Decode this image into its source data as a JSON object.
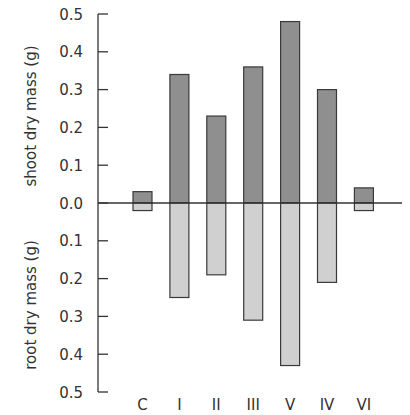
{
  "chart_data": {
    "type": "bar",
    "orientation": "mirrored-vertical",
    "categories": [
      "C",
      "I",
      "II",
      "III",
      "V",
      "IV",
      "VI"
    ],
    "series": [
      {
        "name": "shoot dry mass (g)",
        "direction": "up",
        "color": "#8f8f8f",
        "values": [
          0.03,
          0.34,
          0.23,
          0.36,
          0.48,
          0.3,
          0.04
        ]
      },
      {
        "name": "root dry mass (g)",
        "direction": "down",
        "color": "#d0d0d0",
        "values": [
          0.02,
          0.25,
          0.19,
          0.31,
          0.43,
          0.21,
          0.02
        ]
      }
    ],
    "title": "",
    "xlabel": "",
    "ylabel_top": "shoot dry mass (g)",
    "ylabel_bottom": "root dry mass (g)",
    "yticks_top": [
      "0.5",
      "0.4",
      "0.3",
      "0.2",
      "0.1",
      "0.0"
    ],
    "yticks_bottom": [
      "0.1",
      "0.2",
      "0.3",
      "0.4",
      "0.5"
    ],
    "ylim_top": [
      0,
      0.5
    ],
    "ylim_bottom": [
      0,
      0.5
    ],
    "grid": false,
    "legend": "none",
    "bar_outline_color": "#3a3a3a",
    "axis_color": "#333333"
  }
}
